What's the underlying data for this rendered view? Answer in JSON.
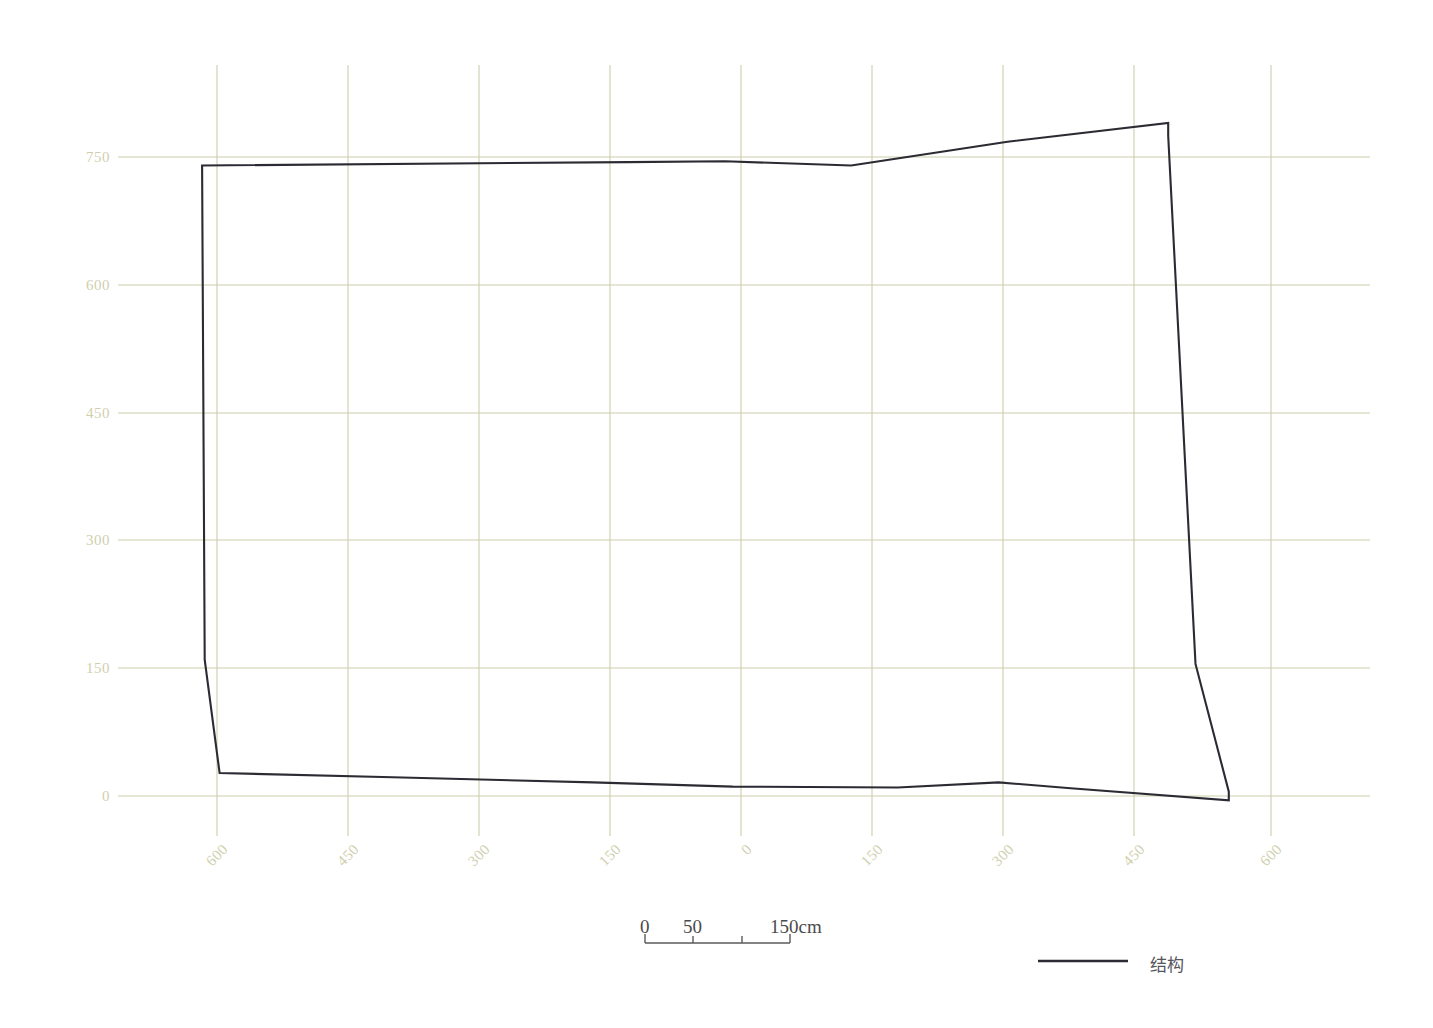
{
  "chart_data": {
    "type": "line",
    "title": "",
    "subtitle": "",
    "xlabel": "",
    "ylabel": "",
    "grid": true,
    "legend_position": "bottom-right",
    "xticks": [
      -600,
      -450,
      -300,
      -150,
      0,
      150,
      300,
      450,
      600
    ],
    "xticklabels": [
      "600",
      "450",
      "300",
      "150",
      "0",
      "150",
      "300",
      "450",
      "600"
    ],
    "yticks": [
      0,
      150,
      300,
      450,
      600,
      750
    ],
    "yticklabels": [
      "0",
      "150",
      "300",
      "450",
      "600",
      "750"
    ],
    "xlim": [
      -680,
      750
    ],
    "ylim": [
      -40,
      830
    ],
    "series": [
      {
        "name": "结构",
        "color": "#2b2b33",
        "closed": true,
        "points": [
          [
            -617,
            740
          ],
          [
            -132,
            744
          ],
          [
            -22,
            745
          ],
          [
            122,
            740
          ],
          [
            300,
            768
          ],
          [
            483,
            790
          ],
          [
            483,
            775
          ],
          [
            514,
            155
          ],
          [
            552,
            5
          ],
          [
            552,
            -5
          ],
          [
            372,
            9
          ],
          [
            290,
            16
          ],
          [
            175,
            10
          ],
          [
            -13,
            11
          ],
          [
            -172,
            16
          ],
          [
            -400,
            22
          ],
          [
            -597,
            27
          ],
          [
            -614,
            160
          ],
          [
            -617,
            740
          ]
        ]
      }
    ],
    "annotations": []
  },
  "scalebar": {
    "labels": [
      "0",
      "50",
      "150cm"
    ],
    "label_positions": [
      0,
      50,
      150
    ],
    "ticks": [
      0,
      50,
      100,
      150
    ],
    "total": 150,
    "unit": "cm"
  },
  "legend": {
    "entries": [
      {
        "label": "结构",
        "color": "#2b2b33",
        "marker": "line"
      }
    ]
  },
  "colors": {
    "grid": "#cdcdab",
    "tick_text": "#cfcfae",
    "structure_line": "#2b2b33",
    "scalebar": "#4b4b4b",
    "background": "#ffffff"
  }
}
